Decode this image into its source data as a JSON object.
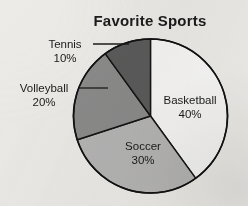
{
  "chart_data": {
    "type": "pie",
    "title": "Favorite Sports",
    "categories": [
      "Basketball",
      "Soccer",
      "Volleyball",
      "Tennis"
    ],
    "values": [
      40,
      30,
      20,
      10
    ],
    "value_suffix": "%",
    "slices": [
      {
        "label": "Basketball",
        "value": 40,
        "value_text": "40%",
        "color": "#f6f6f6",
        "label_placement": "inside",
        "label_x": 190,
        "label_y": 104,
        "value_x": 190,
        "value_y": 118
      },
      {
        "label": "Soccer",
        "value": 30,
        "value_text": "30%",
        "color": "#b5b5b5",
        "label_placement": "inside",
        "label_x": 143,
        "label_y": 150,
        "value_x": 143,
        "value_y": 164
      },
      {
        "label": "Volleyball",
        "value": 20,
        "value_text": "20%",
        "color": "#8b8b8b",
        "label_placement": "outside",
        "label_x": 44,
        "label_y": 92,
        "value_x": 44,
        "value_y": 106,
        "leader": {
          "x1": 78,
          "y1": 88,
          "x2": 108,
          "y2": 88
        }
      },
      {
        "label": "Tennis",
        "value": 10,
        "value_text": "10%",
        "color": "#5b5b5b",
        "label_placement": "outside",
        "label_x": 65,
        "label_y": 48,
        "value_x": 65,
        "value_y": 62,
        "leader": {
          "x1": 93,
          "y1": 44,
          "x2": 129,
          "y2": 44
        }
      }
    ],
    "geometry": {
      "center_x": 150.5,
      "center_y": 116,
      "radius": 77,
      "start_angle_deg": 0,
      "direction": "clockwise"
    },
    "title_x": 150,
    "title_y": 26,
    "legend": "none",
    "grid": false,
    "background_color": "#ecebe8",
    "outline_color": "#121212"
  }
}
